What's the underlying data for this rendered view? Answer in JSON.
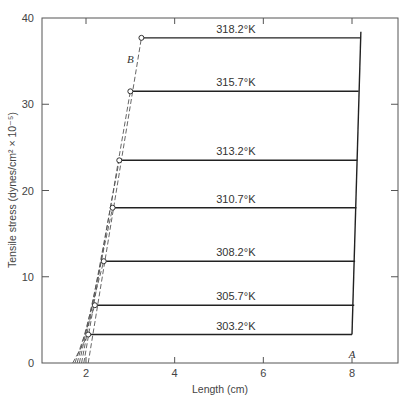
{
  "chart_data": {
    "type": "line",
    "title": "",
    "xlabel": "Length (cm)",
    "ylabel": "Tensile stress (dynes/cm² × 10⁻⁵)",
    "xlim": [
      1,
      9
    ],
    "ylim": [
      0,
      40
    ],
    "xticks": [
      2,
      4,
      6,
      8
    ],
    "yticks": [
      0,
      10,
      20,
      30,
      40
    ],
    "grid": false,
    "legend": "none",
    "series": [
      {
        "name": "318.2°K",
        "stress": 37.7,
        "x_start": 3.25,
        "x_end": 8.2,
        "x_zero": 2.05
      },
      {
        "name": "315.7°K",
        "stress": 31.5,
        "x_start": 3.0,
        "x_end": 8.15,
        "x_zero": 1.95
      },
      {
        "name": "313.2°K",
        "stress": 23.5,
        "x_start": 2.75,
        "x_end": 8.12,
        "x_zero": 1.9
      },
      {
        "name": "310.7°K",
        "stress": 18.0,
        "x_start": 2.6,
        "x_end": 8.1,
        "x_zero": 1.85
      },
      {
        "name": "308.2°K",
        "stress": 11.8,
        "x_start": 2.4,
        "x_end": 8.07,
        "x_zero": 1.8
      },
      {
        "name": "305.7°K",
        "stress": 6.7,
        "x_start": 2.2,
        "x_end": 8.05,
        "x_zero": 1.75
      },
      {
        "name": "303.2°K",
        "stress": 3.3,
        "x_start": 2.05,
        "x_end": 8.0,
        "x_zero": 1.7
      }
    ],
    "annotations": [
      {
        "text": "A",
        "x": 8.0,
        "y": 1.0
      },
      {
        "text": "B",
        "x": 3.0,
        "y": 35.2
      }
    ]
  }
}
